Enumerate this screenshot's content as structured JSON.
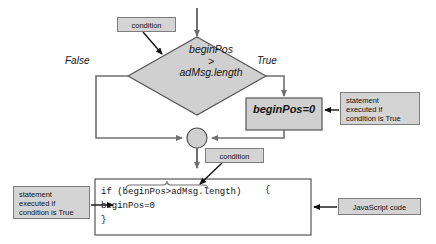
{
  "diagram": {
    "colors": {
      "shape_fill": "#d0d0d0",
      "shape_stroke": "#555555",
      "callout_fill": "#d4d4d4",
      "callout_stroke": "#7d7d7d",
      "line": "#6f6f6f",
      "arrow": "#111111",
      "code_box_fill": "#ffffff",
      "text": "#141414"
    },
    "decision": {
      "shape": "diamond",
      "line1": "beginPos",
      "line2": ">",
      "line3": "adMsg.length"
    },
    "branches": {
      "false_label": "False",
      "true_label": "True"
    },
    "process": {
      "shape": "rectangle",
      "label": "beginPos=0"
    },
    "merge": {
      "shape": "circle",
      "label": ""
    },
    "callouts": {
      "condition_top": "condition",
      "condition_mid": "condition",
      "statement_right": "statement\nexecuted if\ncondition is True",
      "statement_left": "statement\nexecuted if\ncondition is True",
      "javascript": "JavaScript code"
    },
    "code": {
      "line1": "if (beginPos>adMsg.length)",
      "brace_open": "{",
      "line2": "beginPos=0",
      "line3": "}"
    }
  }
}
